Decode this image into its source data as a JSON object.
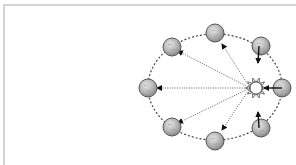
{
  "diagram": {
    "title": "",
    "colors": {
      "frame": "#d4d4d4",
      "orbit": "#444444",
      "planet_fill": "#b8b8b8",
      "planet_stroke": "#555555",
      "sun_fill": "#ffffff",
      "sun_stroke": "#333333",
      "ray_line": "#777777",
      "arrow": "#111111"
    },
    "orbit": {
      "cx": 215,
      "cy": 87,
      "rx": 67,
      "ry": 53
    },
    "sun": {
      "name": "sun",
      "cx": 256,
      "cy": 88,
      "r": 6
    },
    "planets": [
      {
        "name": "planet-top",
        "cx": 215,
        "cy": 33,
        "r": 9
      },
      {
        "name": "planet-top-left",
        "cx": 172,
        "cy": 47,
        "r": 9
      },
      {
        "name": "planet-top-right",
        "cx": 261,
        "cy": 46,
        "r": 9
      },
      {
        "name": "planet-left",
        "cx": 148,
        "cy": 88,
        "r": 9
      },
      {
        "name": "planet-right",
        "cx": 282,
        "cy": 88,
        "r": 9
      },
      {
        "name": "planet-bottom-left",
        "cx": 172,
        "cy": 127,
        "r": 9
      },
      {
        "name": "planet-bottom",
        "cx": 215,
        "cy": 141,
        "r": 9
      },
      {
        "name": "planet-bottom-right",
        "cx": 261,
        "cy": 128,
        "r": 9
      }
    ],
    "dotted_rays_from_sun": [
      {
        "to": "planet-top",
        "x2": 222,
        "y2": 44
      },
      {
        "to": "planet-top-left",
        "x2": 178,
        "y2": 51
      },
      {
        "to": "planet-left",
        "x2": 157,
        "y2": 88
      },
      {
        "to": "planet-bottom-left",
        "x2": 178,
        "y2": 123
      },
      {
        "to": "planet-bottom",
        "x2": 222,
        "y2": 130
      }
    ],
    "solid_arrows_to_sun": [
      {
        "from": "planet-right",
        "x1": 282,
        "y1": 88,
        "x2": 264,
        "y2": 88
      },
      {
        "from": "planet-top-right",
        "x1": 259,
        "y1": 46,
        "x2": 258,
        "y2": 63
      },
      {
        "from": "planet-bottom-right",
        "x1": 259,
        "y1": 128,
        "x2": 258,
        "y2": 112
      }
    ]
  }
}
